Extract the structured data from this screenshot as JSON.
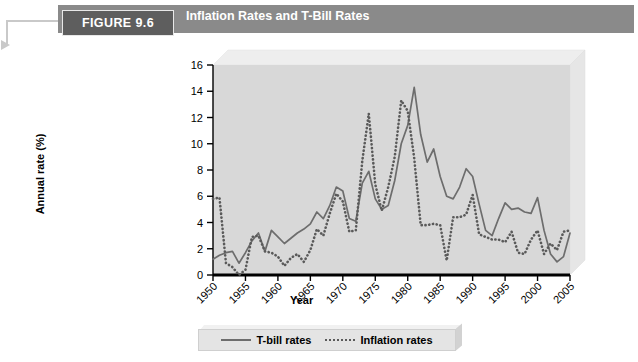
{
  "header": {
    "figure_badge": "FIGURE 9.6",
    "title": "Inflation Rates and T-Bill Rates",
    "bar_color": "#8a8a8a",
    "badge_color": "#5e5e5e"
  },
  "callout": {
    "icon": "arrow-right-icon"
  },
  "chart_data": {
    "type": "line",
    "title": "Inflation Rates and T-Bill Rates",
    "xlabel": "Year",
    "ylabel": "Annual rate (%)",
    "xlim": [
      1950,
      2005
    ],
    "ylim": [
      0,
      16
    ],
    "ytick_values": [
      0,
      2,
      4,
      6,
      8,
      10,
      12,
      14,
      16
    ],
    "xtick_values": [
      1950,
      1955,
      1960,
      1965,
      1970,
      1975,
      1980,
      1985,
      1990,
      1995,
      2000,
      2005
    ],
    "xtick_labels": [
      "1950",
      "1955",
      "1960",
      "1965",
      "1970",
      "1975",
      "1980",
      "1985",
      "1990",
      "1995",
      "2000",
      "2005"
    ],
    "grid": false,
    "legend_position": "bottom",
    "plot_bg": "#d8d8d8",
    "x": [
      1950,
      1951,
      1952,
      1953,
      1954,
      1955,
      1956,
      1957,
      1958,
      1959,
      1960,
      1961,
      1962,
      1963,
      1964,
      1965,
      1966,
      1967,
      1968,
      1969,
      1970,
      1971,
      1972,
      1973,
      1974,
      1975,
      1976,
      1977,
      1978,
      1979,
      1980,
      1981,
      1982,
      1983,
      1984,
      1985,
      1986,
      1987,
      1988,
      1989,
      1990,
      1991,
      1992,
      1993,
      1994,
      1995,
      1996,
      1997,
      1998,
      1999,
      2000,
      2001,
      2002,
      2003,
      2004,
      2005
    ],
    "series": [
      {
        "name": "T-bill rates",
        "style": "solid",
        "color": "#6d6d6d",
        "values": [
          1.2,
          1.5,
          1.7,
          1.8,
          0.9,
          1.7,
          2.6,
          3.2,
          1.8,
          3.4,
          2.9,
          2.4,
          2.8,
          3.2,
          3.5,
          3.9,
          4.8,
          4.3,
          5.3,
          6.7,
          6.4,
          4.3,
          4.1,
          7.0,
          7.9,
          5.8,
          5.0,
          5.3,
          7.2,
          10.0,
          11.4,
          14.3,
          10.7,
          8.6,
          9.6,
          7.5,
          6.0,
          5.8,
          6.7,
          8.1,
          7.5,
          5.4,
          3.4,
          3.0,
          4.3,
          5.5,
          5.0,
          5.1,
          4.8,
          4.7,
          5.9,
          3.4,
          1.6,
          1.0,
          1.4,
          3.2
        ]
      },
      {
        "name": "Inflation rates",
        "style": "dotted",
        "color": "#5a5a5a",
        "values": [
          5.8,
          5.9,
          0.9,
          0.6,
          -0.5,
          0.4,
          2.9,
          3.0,
          1.8,
          1.7,
          1.4,
          0.7,
          1.3,
          1.6,
          1.0,
          1.9,
          3.5,
          3.0,
          4.7,
          6.2,
          5.6,
          3.3,
          3.4,
          8.7,
          12.3,
          6.9,
          4.9,
          6.7,
          9.0,
          13.3,
          12.5,
          8.9,
          3.8,
          3.8,
          3.9,
          3.8,
          1.1,
          4.4,
          4.4,
          4.6,
          6.1,
          3.1,
          2.9,
          2.7,
          2.7,
          2.5,
          3.3,
          1.7,
          1.6,
          2.7,
          3.4,
          1.6,
          2.4,
          1.9,
          3.3,
          3.4
        ]
      }
    ]
  },
  "legend": {
    "entries": [
      {
        "label": "T-bill rates",
        "style": "solid"
      },
      {
        "label": "Inflation rates",
        "style": "dotted"
      }
    ]
  }
}
